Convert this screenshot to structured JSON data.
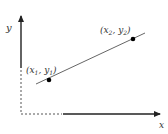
{
  "diagram": {
    "axes": {
      "x_label": "x",
      "y_label": "y"
    },
    "points": [
      {
        "name": "x",
        "index": "1",
        "name2": "y",
        "index2": "1",
        "label": "(x1, y1)"
      },
      {
        "name": "x",
        "index": "2",
        "name2": "y",
        "index2": "2",
        "label": "(x2, y2)"
      }
    ],
    "colors": {
      "axis": "#222222",
      "line": "#555555",
      "point": "#000000",
      "dashed": "#555555"
    }
  }
}
